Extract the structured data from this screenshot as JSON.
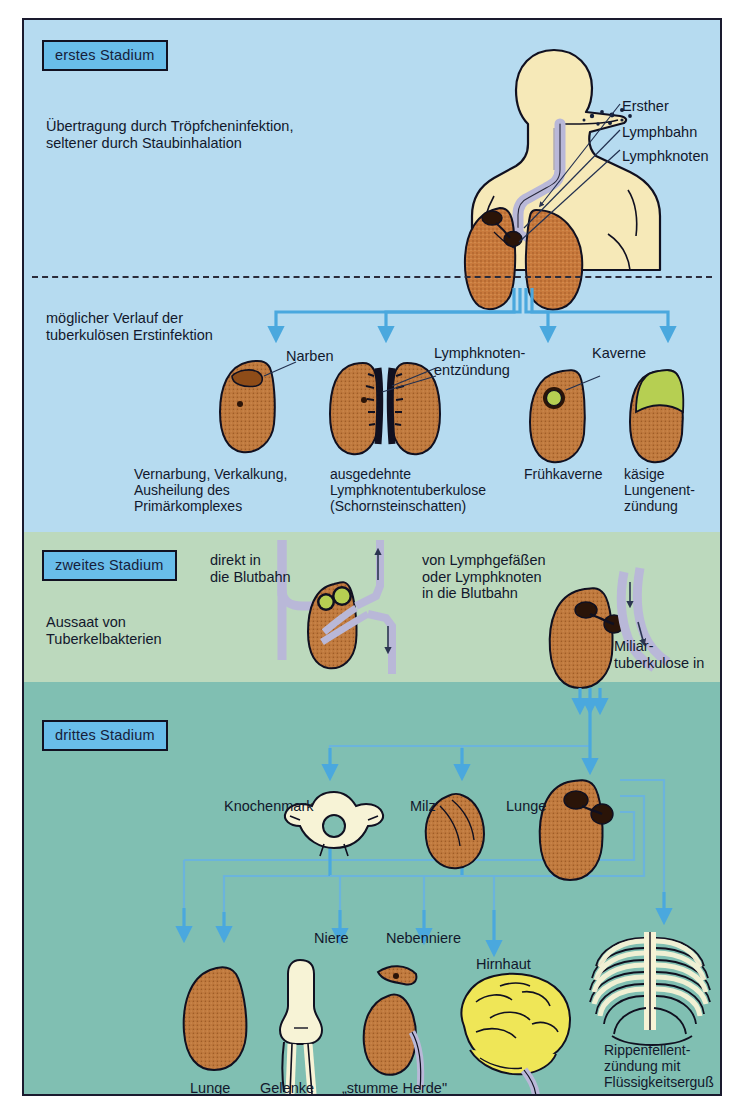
{
  "poster": {
    "title_stage1": "erstes Stadium",
    "title_stage2": "zweites Stadium",
    "title_stage3": "drittes Stadium"
  },
  "stage1": {
    "transmission_text": "Übertragung durch Tröpfcheninfektion,\nseltener durch Staubinhalation",
    "anatomy_labels": [
      {
        "id": "ersttherd",
        "text": "Ersther"
      },
      {
        "id": "ersther",
        "text": "Ersterd"
      }
    ],
    "callouts": [
      "Ersther",
      "Lymphbahn",
      "Lymphknoten"
    ],
    "callout_primary": "Ersther"
  },
  "stage1b": {
    "course_text": "möglicher Verlauf der\ntuberkulösen Erstinfektion",
    "pointer_labels": [
      "Narben",
      "Lymphknoten-\nentzündung",
      "Kaverne"
    ],
    "captions": [
      "Vernarbung, Verkalkung,\nAusheilung des\nPrimärkomplexes",
      "ausgedehnte\nLymphknotentuberkulose\n(Schornsteinschatten)",
      "Frühkaverne",
      "käsige\nLungenent-\nzündung"
    ]
  },
  "stage2": {
    "dissemination_text": "Aussaat von\nTuberkelbakterien",
    "route_direct": "direkt in\ndie Blutbahn",
    "route_lymph": "von Lymphgefäßen\noder Lymphknoten\nin die Blutbahn",
    "miliary": "Miliar-\ntuberkulose in"
  },
  "stage3": {
    "organ_labels_row1": [
      "Knochenmark",
      "Milz",
      "Lunge"
    ],
    "organ_labels_row2": [
      "Niere",
      "Nebenniere",
      "Hirnhaut"
    ],
    "organ_labels_row3": [
      "Lunge",
      "Gelenke",
      "„stumme Herde\""
    ],
    "pleurisy": "Rippenfellent-\nzündung mit\nFlüssigkeitserguß"
  },
  "colors": {
    "band_blue": "#b6dbf0",
    "band_green": "#bcd9bd",
    "band_teal": "#80bfb2",
    "stage_box": "#69bdea",
    "lung": "#c8793c",
    "lung_dark": "#a85c28",
    "skin": "#f6e9b8",
    "bone": "#f7f3d6",
    "caseous_green": "#b6cf52",
    "brain_yellow": "#efe657",
    "vessel": "#b9b8d8",
    "arrow_blue": "#4aa8de",
    "ink": "#12182c"
  }
}
